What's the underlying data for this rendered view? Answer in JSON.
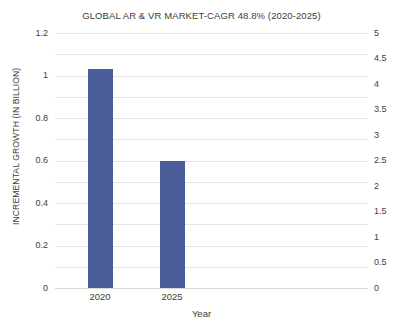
{
  "chart_data": {
    "type": "bar",
    "title": "GLOBAL AR & VR MARKET-CAGR 48.8% (2020-2025)",
    "categories": [
      "2020",
      "2025"
    ],
    "values": [
      1.03,
      0.6
    ],
    "xlabel": "Year",
    "ylabel": "INCREMENTAL GROWTH (IN BILLION)",
    "ylim": [
      0,
      1.2
    ],
    "yticks": [
      "0",
      "0.2",
      "0.4",
      "0.6",
      "0.8",
      "1",
      "1.2"
    ],
    "y2lim": [
      0,
      5
    ],
    "y2ticks": [
      "0",
      "0.5",
      "1",
      "1.5",
      "2",
      "2.5",
      "3",
      "3.5",
      "4",
      "4.5",
      "5"
    ],
    "grid": true,
    "legend": null,
    "series": [
      {
        "name": "Incremental growth",
        "values": [
          1.03,
          0.6
        ],
        "color": "#4a5d98"
      }
    ]
  },
  "style": {
    "bar_color": "#4a5d98",
    "grid_color": "#e6e6e6",
    "text_color": "#3c3c3c",
    "background": "#ffffff"
  }
}
